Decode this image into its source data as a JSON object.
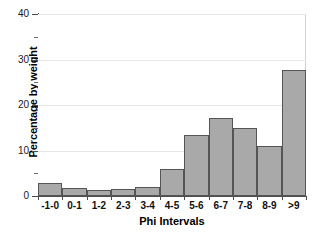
{
  "chart_data": {
    "type": "bar",
    "title": "",
    "xlabel": "Phi Intervals",
    "ylabel": "Percentage by weight",
    "categories": [
      "-1-0",
      "0-1",
      "1-2",
      "2-3",
      "3-4",
      "4-5",
      "5-6",
      "6-7",
      "7-8",
      "8-9",
      ">9"
    ],
    "values": [
      2.9,
      1.8,
      1.4,
      1.5,
      2.0,
      6.0,
      13.4,
      17.1,
      15.0,
      11.0,
      27.7
    ],
    "ylim": [
      0,
      40
    ],
    "xlim_note": "categorical, 11 equal-width contiguous bins",
    "y_major_ticks": [
      0,
      10,
      20,
      30,
      40
    ],
    "y_minor_ticks": [
      5,
      15,
      25,
      35
    ],
    "y_tick_labels": [
      "0",
      "10",
      "20",
      "30",
      "40"
    ],
    "grid": "horizontal major gridlines only",
    "legend": "none",
    "bar_fill_color": "#a9a9a9",
    "bar_edge_color": "#555555",
    "gridline_color": "#e6e6e6",
    "axis_color": "#4d4d4d",
    "background_color": "#ffffff"
  }
}
